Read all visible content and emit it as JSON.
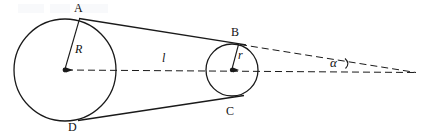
{
  "figure": {
    "background_color": "#ffffff",
    "stroke_color": "#1a1a1a",
    "width": 422,
    "height": 140,
    "labels": {
      "point_a": "A",
      "point_b": "B",
      "point_c": "C",
      "point_d": "D",
      "radius_large": "R",
      "radius_small": "r",
      "distance": "l",
      "angle": "α"
    },
    "geometry": {
      "large_circle": {
        "cx": 65,
        "cy": 70,
        "r": 51
      },
      "small_circle": {
        "cx": 232,
        "cy": 70,
        "r": 26
      },
      "tangent_point_a": {
        "x": 80,
        "y": 19
      },
      "tangent_point_b": {
        "x": 238,
        "y": 44
      },
      "tangent_point_c": {
        "x": 234,
        "y": 96
      },
      "tangent_point_d": {
        "x": 79,
        "y": 120
      },
      "apex": {
        "x": 416,
        "y": 72
      },
      "axis_start": {
        "x": 65,
        "y": 70
      },
      "axis_end": {
        "x": 416,
        "y": 72
      }
    }
  }
}
